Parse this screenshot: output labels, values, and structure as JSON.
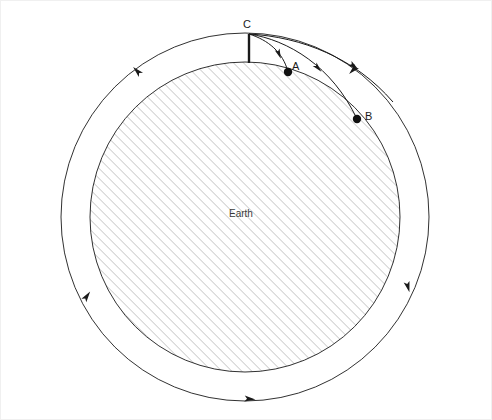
{
  "diagram": {
    "background_color": "#ffffff",
    "stroke_color": "#1a1a1a",
    "hatch_color": "#9a9a9a",
    "frame_color": "#f0f0f0",
    "width": 492,
    "height": 420
  },
  "earth": {
    "label": "Earth",
    "center_x": 245,
    "center_y": 217,
    "radius": 155,
    "fill": "hatched",
    "hatch_angle_deg": 45,
    "hatch_spacing_px": 5
  },
  "orbit": {
    "name": "circular-orbit",
    "center_x": 245,
    "center_y": 217,
    "radius": 184,
    "direction": "counterclockwise",
    "arrow_count": 5
  },
  "cannon": {
    "name": "mountain-cannon",
    "label": "C",
    "x": 249,
    "y": 34,
    "base_x": 249,
    "base_y": 63,
    "description": "vertical mountain stalk from Earth surface to launch point C"
  },
  "points": [
    {
      "label": "C",
      "x": 249,
      "y": 34,
      "kind": "launch",
      "marked": false
    },
    {
      "label": "A",
      "x": 288,
      "y": 72,
      "kind": "impact",
      "marked": true
    },
    {
      "label": "B",
      "x": 357,
      "y": 119,
      "kind": "impact",
      "marked": true
    }
  ],
  "trajectories": [
    {
      "name": "trajectory-to-A",
      "from": "C",
      "to": "A",
      "arrowhead": true,
      "path": "M 249 34 C 268 40, 283 52, 288 72"
    },
    {
      "name": "trajectory-to-B",
      "from": "C",
      "to": "B",
      "arrowhead": true,
      "path": "M 249 34 C 288 40, 332 66, 357 119"
    },
    {
      "name": "trajectory-orbit",
      "from": "C",
      "to": "orbit",
      "arrowhead": true,
      "path": "M 249 34 C 302 37, 355 58, 393 102"
    }
  ],
  "orbit_arrows": [
    {
      "name": "orbit-arrow-upper-left",
      "x": 137,
      "y": 71,
      "angle_deg": 225
    },
    {
      "name": "orbit-arrow-lower-left",
      "x": 87,
      "y": 296,
      "angle_deg": 305
    },
    {
      "name": "orbit-arrow-bottom",
      "x": 250,
      "y": 399,
      "angle_deg": 5
    },
    {
      "name": "orbit-arrow-lower-right",
      "x": 408,
      "y": 287,
      "angle_deg": 75
    },
    {
      "name": "orbit-arrow-upper-right",
      "x": 353,
      "y": 70,
      "angle_deg": 135
    }
  ]
}
